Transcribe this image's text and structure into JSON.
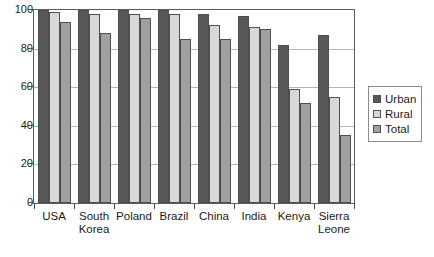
{
  "chart_data": {
    "type": "bar",
    "title": "",
    "xlabel": "",
    "ylabel": "",
    "ylim": [
      0,
      100
    ],
    "yticks": [
      0,
      20,
      40,
      60,
      80,
      100
    ],
    "grid": true,
    "legend_position": "right",
    "categories": [
      "USA",
      "South Korea",
      "Poland",
      "Brazil",
      "China",
      "India",
      "Kenya",
      "Sierra Leone"
    ],
    "category_lines": [
      [
        "USA"
      ],
      [
        "South",
        "Korea"
      ],
      [
        "Poland"
      ],
      [
        "Brazil"
      ],
      [
        "China"
      ],
      [
        "India"
      ],
      [
        "Kenya"
      ],
      [
        "Sierra",
        "Leone"
      ]
    ],
    "series": [
      {
        "name": "Urban",
        "color": "#585858",
        "values": [
          100,
          100,
          100,
          100,
          98,
          97,
          82,
          87
        ]
      },
      {
        "name": "Rural",
        "color": "#d8d8d8",
        "values": [
          99,
          98,
          98,
          98,
          92,
          91,
          59,
          55
        ]
      },
      {
        "name": "Total",
        "color": "#a0a0a0",
        "values": [
          94,
          88,
          96,
          85,
          85,
          90,
          52,
          35
        ]
      }
    ]
  },
  "legend": {
    "items": [
      {
        "label": "Urban",
        "color": "#585858"
      },
      {
        "label": "Rural",
        "color": "#d8d8d8"
      },
      {
        "label": "Total",
        "color": "#a0a0a0"
      }
    ]
  },
  "caption": {
    "text": ""
  }
}
